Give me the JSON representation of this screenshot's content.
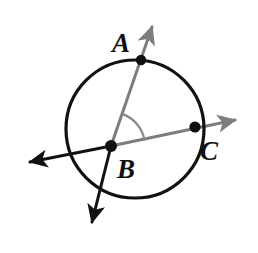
{
  "figure": {
    "type": "geometry-diagram",
    "canvas": {
      "width": 258,
      "height": 253,
      "background": "#ffffff"
    },
    "colors": {
      "circle_stroke": "#111111",
      "black_ray": "#111111",
      "gray_ray": "#7d7d7d",
      "arc": "#8a8a8a",
      "point_fill": "#111111",
      "label_text": "#111111"
    },
    "circle": {
      "name": "main-circle",
      "cx": 135,
      "cy": 129,
      "r": 69,
      "stroke_width": 3.2
    },
    "points": [
      {
        "id": "A",
        "label": "A",
        "x": 141,
        "y": 60,
        "r": 5.2,
        "label_x": 112,
        "label_y": 52
      },
      {
        "id": "B",
        "label": "B",
        "x": 111,
        "y": 146,
        "r": 6.0,
        "label_x": 117,
        "label_y": 178
      },
      {
        "id": "C",
        "label": "C",
        "x": 195,
        "y": 127,
        "r": 5.6,
        "label_x": 200,
        "label_y": 160
      }
    ],
    "lines": [
      {
        "id": "line-BA",
        "name": "ray-b-through-a",
        "color": "gray",
        "from": {
          "x": 111,
          "y": 146
        },
        "to": {
          "x": 152,
          "y": 27
        },
        "arrow_at": "to",
        "stroke_width": 3.0
      },
      {
        "id": "line-B-down",
        "name": "ray-b-opposite-a",
        "color": "black",
        "from": {
          "x": 111,
          "y": 146
        },
        "to": {
          "x": 92,
          "y": 222
        },
        "arrow_at": "to",
        "stroke_width": 3.0
      },
      {
        "id": "line-BC",
        "name": "ray-b-through-c",
        "color": "gray",
        "from": {
          "x": 111,
          "y": 146
        },
        "to": {
          "x": 235,
          "y": 120
        },
        "arrow_at": "to",
        "stroke_width": 3.0
      },
      {
        "id": "line-B-left",
        "name": "ray-b-opposite-c",
        "color": "black",
        "from": {
          "x": 111,
          "y": 146
        },
        "to": {
          "x": 30,
          "y": 162
        },
        "arrow_at": "to",
        "stroke_width": 3.0
      }
    ],
    "angle_arc": {
      "name": "angle-abc-arc",
      "vertex": {
        "x": 111,
        "y": 146
      },
      "radius": 34,
      "start_angle_deg": -11,
      "end_angle_deg": -71,
      "stroke_width": 2.2,
      "color": "#8a8a8a"
    }
  }
}
